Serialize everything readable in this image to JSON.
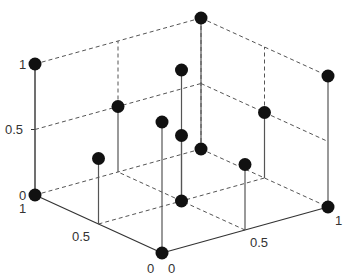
{
  "chart_data": {
    "type": "scatter",
    "subtype": "3d-stem",
    "title": "",
    "xlabel": "",
    "ylabel": "",
    "zlabel": "",
    "grid": false,
    "legend": null,
    "axes": {
      "x": {
        "range": [
          0,
          1
        ],
        "ticks": [
          0,
          0.5,
          1
        ],
        "tick_labels": [
          "0",
          "0.5",
          "1"
        ]
      },
      "y": {
        "range": [
          0,
          1
        ],
        "ticks": [
          0,
          0.5,
          1
        ],
        "tick_labels": [
          "0",
          "0.5",
          "1"
        ]
      },
      "z": {
        "range": [
          0,
          1
        ],
        "ticks": [
          0,
          0.5,
          1
        ],
        "tick_labels": [
          "0",
          "0.5",
          "1"
        ]
      }
    },
    "points": [
      {
        "x": 1,
        "y": 0,
        "z": 1
      },
      {
        "x": 1,
        "y": 0,
        "z": 0
      },
      {
        "x": 1,
        "y": 1,
        "z": 1
      },
      {
        "x": 0,
        "y": 1,
        "z": 1
      },
      {
        "x": 0,
        "y": 1,
        "z": 0
      },
      {
        "x": 0,
        "y": 0,
        "z": 0
      },
      {
        "x": 1,
        "y": 1,
        "z": 0
      },
      {
        "x": 1,
        "y": 0.5,
        "z": 0.5
      },
      {
        "x": 0.5,
        "y": 0,
        "z": 0.5
      },
      {
        "x": 0,
        "y": 0,
        "z": 1
      },
      {
        "x": 0.5,
        "y": 0.5,
        "z": 0
      },
      {
        "x": 0.5,
        "y": 0.5,
        "z": 0.5
      },
      {
        "x": 0.5,
        "y": 0.5,
        "z": 1
      },
      {
        "x": 0.5,
        "y": 1,
        "z": 0.5
      },
      {
        "x": 0,
        "y": 0.5,
        "z": 0.5
      }
    ],
    "colors": {
      "marker": "#111111",
      "stem": "#555555",
      "axis": "#333333",
      "dashed": "#555555",
      "text": "#333333"
    }
  },
  "labels": {
    "z_ticks": [
      "1",
      "0.5",
      "0"
    ],
    "x_ticks": [
      "1",
      "0.5",
      "0"
    ],
    "y_ticks": [
      "0",
      "0.5",
      "1"
    ]
  }
}
